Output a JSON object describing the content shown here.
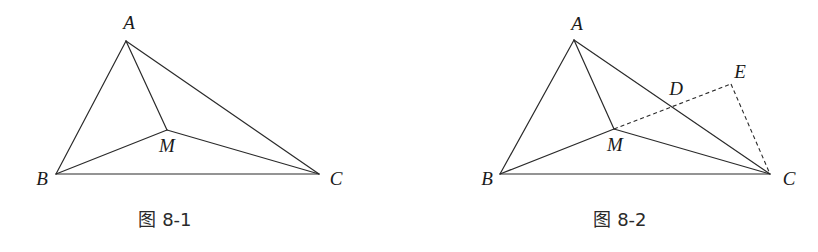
{
  "figures": [
    {
      "id": "fig1",
      "caption": "图 8-1",
      "points": {
        "A": {
          "label": "A",
          "x": 126,
          "y": 41,
          "lx": 129,
          "ly": 29
        },
        "B": {
          "label": "B",
          "x": 56,
          "y": 174,
          "lx": 42,
          "ly": 185
        },
        "C": {
          "label": "C",
          "x": 319,
          "y": 174,
          "lx": 336,
          "ly": 185
        },
        "M": {
          "label": "M",
          "x": 167,
          "y": 130,
          "lx": 167,
          "ly": 152
        }
      },
      "segments": [
        "AB",
        "AC",
        "BC",
        "AM",
        "BM",
        "CM"
      ],
      "dashed_segments": []
    },
    {
      "id": "fig2",
      "caption": "图 8-2",
      "points": {
        "A": {
          "label": "A",
          "x": 574,
          "y": 40,
          "lx": 577,
          "ly": 30
        },
        "B": {
          "label": "B",
          "x": 500,
          "y": 174,
          "lx": 487,
          "ly": 185
        },
        "C": {
          "label": "C",
          "x": 770,
          "y": 174,
          "lx": 789,
          "ly": 185
        },
        "M": {
          "label": "M",
          "x": 614,
          "y": 129,
          "lx": 615,
          "ly": 151
        },
        "D": {
          "label": "D",
          "x": 672,
          "y": 107,
          "lx": 674,
          "ly": 95
        },
        "E": {
          "label": "E",
          "x": 731,
          "y": 84,
          "lx": 740,
          "ly": 78
        }
      },
      "segments": [
        "AB",
        "AC",
        "BC",
        "AM",
        "BM",
        "CM"
      ],
      "dashed_segments": [
        "ME",
        "EC"
      ]
    }
  ]
}
